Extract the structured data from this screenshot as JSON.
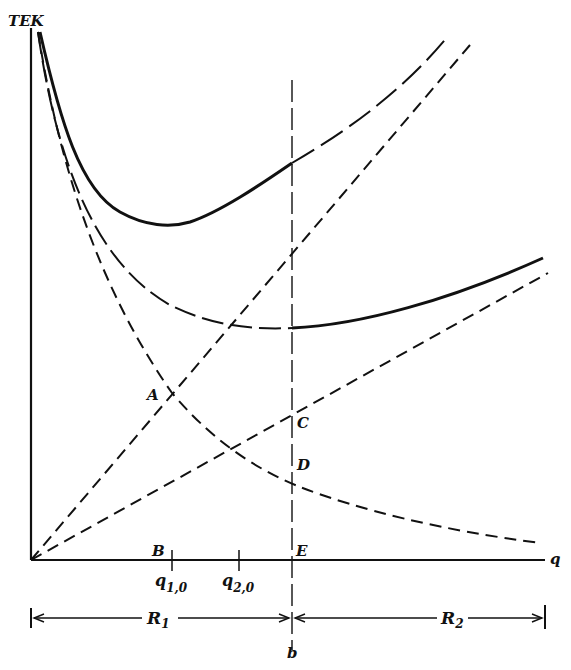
{
  "diagram": {
    "y_axis_label": "TEK",
    "x_axis_label": "q",
    "points": {
      "A": "A",
      "B": "B",
      "C": "C",
      "D": "D",
      "E": "E"
    },
    "ticks": [
      {
        "base": "q",
        "sub": "1,0"
      },
      {
        "base": "q",
        "sub": "2,0"
      }
    ],
    "boundary_label": "b",
    "ranges": [
      {
        "base": "R",
        "sub": "1"
      },
      {
        "base": "R",
        "sub": "2"
      }
    ],
    "curves": [
      "total-cost-curve-R1 (solid, U-shaped, then long-dash beyond b)",
      "total-cost-curve-R2 (long-dash in R1, solid beyond b)",
      "fixed-cost-hyperbola (dashed, decreasing)",
      "variable-cost-line-1 (steep dashed line through A)",
      "variable-cost-line-2 (shallow dashed line through C)",
      "boundary-line b (vertical long-dash)"
    ],
    "colors": {
      "ink": "#111111",
      "background": "#ffffff"
    }
  }
}
